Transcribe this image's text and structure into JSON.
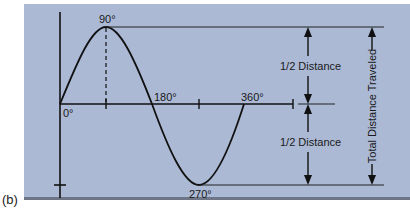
{
  "figure": {
    "label": "(b)",
    "angles": {
      "a0": "0°",
      "a90": "90°",
      "a180": "180°",
      "a270": "270°",
      "a360": "360°"
    },
    "half_distance_upper": "1/2 Distance",
    "half_distance_lower": "1/2 Distance",
    "total_distance": "Total Distance Traveled",
    "colors": {
      "background": "#abb9d5",
      "line": "#111111"
    }
  }
}
